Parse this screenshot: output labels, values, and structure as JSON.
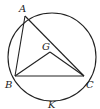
{
  "diagram": {
    "type": "geometry",
    "circle": {
      "cx": 52,
      "cy": 57,
      "r": 44
    },
    "points": {
      "A": {
        "label": "A",
        "x": 25,
        "y": 16
      },
      "B": {
        "label": "B",
        "x": 15,
        "y": 76
      },
      "C": {
        "label": "C",
        "x": 84,
        "y": 76
      },
      "G": {
        "label": "G",
        "x": 50,
        "y": 52
      },
      "K": {
        "label": "K",
        "x": 52,
        "y": 101
      }
    },
    "segments": [
      [
        "A",
        "B"
      ],
      [
        "A",
        "C"
      ],
      [
        "B",
        "C"
      ],
      [
        "B",
        "G"
      ],
      [
        "G",
        "C"
      ]
    ],
    "labels": {
      "A": "A",
      "B": "B",
      "C": "C",
      "G": "G",
      "K": "K"
    }
  }
}
